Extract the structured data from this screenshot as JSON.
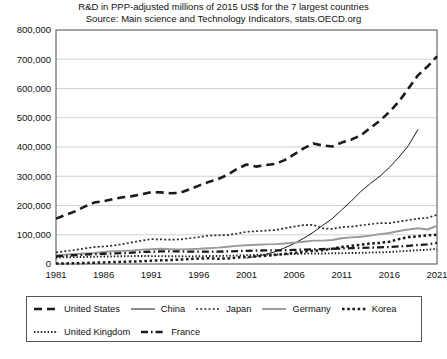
{
  "title": {
    "line1": "R&D in PPP-adjusted millions of 2015 US$ for the 7 largest countries",
    "line2": "Source: Main science and Technology Indicators, stats.OECD.org"
  },
  "chart_data": {
    "type": "line",
    "title": "R&D in PPP-adjusted millions of 2015 US$ for the 7 largest countries",
    "subtitle": "Source: Main science and Technology Indicators, stats.OECD.org",
    "xlabel": "",
    "ylabel": "",
    "xlim": [
      1981,
      2021
    ],
    "ylim": [
      0,
      800000
    ],
    "ytick_labels": [
      "800,000",
      "700,000",
      "600,000",
      "500,000",
      "400,000",
      "300,000",
      "200,000",
      "100,000",
      "0"
    ],
    "ytick_values": [
      800000,
      700000,
      600000,
      500000,
      400000,
      300000,
      200000,
      100000,
      0
    ],
    "xtick_labels": [
      "1981",
      "1986",
      "1991",
      "1996",
      "2001",
      "2006",
      "2011",
      "2016",
      "2021"
    ],
    "xtick_values": [
      1981,
      1986,
      1991,
      1996,
      2001,
      2006,
      2011,
      2016,
      2021
    ],
    "grid": true,
    "legend_position": "bottom",
    "x": [
      1981,
      1982,
      1983,
      1984,
      1985,
      1986,
      1987,
      1988,
      1989,
      1990,
      1991,
      1992,
      1993,
      1994,
      1995,
      1996,
      1997,
      1998,
      1999,
      2000,
      2001,
      2002,
      2003,
      2004,
      2005,
      2006,
      2007,
      2008,
      2009,
      2010,
      2011,
      2012,
      2013,
      2014,
      2015,
      2016,
      2017,
      2018,
      2019,
      2020,
      2021
    ],
    "series": [
      {
        "name": "United States",
        "style": "thick-dashed",
        "color": "#1a1a1a",
        "values": [
          155000,
          168000,
          180000,
          196000,
          210000,
          215000,
          222000,
          228000,
          232000,
          238000,
          246000,
          245000,
          242000,
          243000,
          255000,
          268000,
          280000,
          290000,
          305000,
          325000,
          340000,
          333000,
          338000,
          342000,
          355000,
          375000,
          395000,
          412000,
          405000,
          402000,
          415000,
          425000,
          440000,
          465000,
          490000,
          520000,
          555000,
          600000,
          645000,
          675000,
          710000
        ]
      },
      {
        "name": "China",
        "style": "thin-solid",
        "color": "#1a1a1a",
        "values": [
          null,
          null,
          null,
          null,
          null,
          null,
          null,
          null,
          null,
          null,
          null,
          null,
          null,
          null,
          null,
          null,
          null,
          null,
          null,
          null,
          20000,
          26000,
          33000,
          42000,
          55000,
          70000,
          88000,
          108000,
          132000,
          155000,
          185000,
          215000,
          248000,
          275000,
          300000,
          330000,
          365000,
          405000,
          460000,
          null,
          null
        ]
      },
      {
        "name": "Japan",
        "style": "dotted",
        "color": "#2b2b2b",
        "values": [
          40000,
          44000,
          48000,
          53000,
          58000,
          60000,
          63000,
          68000,
          74000,
          80000,
          85000,
          84000,
          83000,
          84000,
          88000,
          92000,
          97000,
          98000,
          99000,
          104000,
          110000,
          112000,
          114000,
          116000,
          122000,
          128000,
          133000,
          134000,
          122000,
          120000,
          126000,
          128000,
          132000,
          136000,
          140000,
          140000,
          145000,
          150000,
          155000,
          158000,
          168000
        ]
      },
      {
        "name": "Germany",
        "style": "gray-solid",
        "color": "#9a9a9a",
        "values": [
          30000,
          32000,
          34000,
          36000,
          38000,
          41000,
          44000,
          45000,
          46000,
          49000,
          51000,
          52000,
          51000,
          50000,
          51000,
          52000,
          54000,
          56000,
          59000,
          62000,
          64000,
          66000,
          67000,
          68000,
          70000,
          73000,
          76000,
          80000,
          80000,
          82000,
          88000,
          91000,
          93000,
          97000,
          102000,
          106000,
          113000,
          118000,
          122000,
          118000,
          130000
        ]
      },
      {
        "name": "Korea",
        "style": "square-dots",
        "color": "#1a1a1a",
        "values": [
          1500,
          2000,
          2600,
          3400,
          4500,
          5500,
          6600,
          7500,
          8500,
          9500,
          11000,
          12500,
          13500,
          15000,
          17000,
          18500,
          19500,
          18000,
          19000,
          22000,
          24000,
          26000,
          28000,
          31000,
          34000,
          38000,
          42000,
          45000,
          47000,
          52000,
          58000,
          62000,
          66000,
          70000,
          72000,
          76000,
          85000,
          92000,
          95000,
          98000,
          100000
        ]
      },
      {
        "name": "United Kingdom",
        "style": "fine-dots",
        "color": "#1a1a1a",
        "values": [
          22000,
          23000,
          23500,
          24000,
          25000,
          25500,
          26000,
          26500,
          27000,
          27500,
          27000,
          27000,
          26500,
          26500,
          26000,
          26500,
          27000,
          27500,
          28000,
          29000,
          30000,
          31000,
          32000,
          32500,
          33000,
          34000,
          35000,
          36000,
          36000,
          36500,
          37000,
          37500,
          38000,
          39000,
          40000,
          41000,
          43000,
          45000,
          47000,
          49000,
          52000
        ]
      },
      {
        "name": "France",
        "style": "dash-dot",
        "color": "#1a1a1a",
        "values": [
          26000,
          28000,
          30000,
          32000,
          34000,
          35000,
          36000,
          37000,
          39000,
          41000,
          42000,
          43000,
          43500,
          43000,
          42500,
          42000,
          42000,
          42500,
          43000,
          44000,
          45000,
          46000,
          46500,
          46500,
          47000,
          48500,
          49000,
          50000,
          51000,
          52000,
          53000,
          54000,
          55000,
          56000,
          57000,
          58000,
          60000,
          62000,
          65000,
          67000,
          72000
        ]
      }
    ]
  },
  "legend": {
    "items": [
      {
        "label": "United States",
        "style": "thick-dashed"
      },
      {
        "label": "China",
        "style": "thin-solid"
      },
      {
        "label": "Japan",
        "style": "dotted"
      },
      {
        "label": "Germany",
        "style": "gray-solid"
      },
      {
        "label": "Korea",
        "style": "square-dots"
      },
      {
        "label": "United Kingdom",
        "style": "fine-dots"
      },
      {
        "label": "France",
        "style": "dash-dot"
      }
    ]
  }
}
